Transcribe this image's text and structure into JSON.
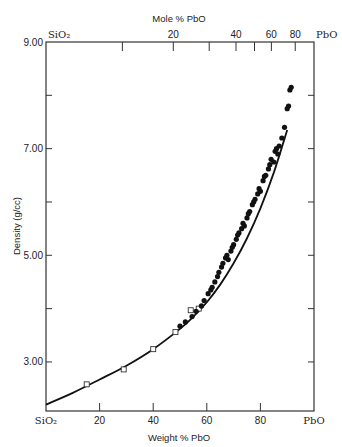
{
  "chart_data": {
    "type": "scatter",
    "title": "",
    "xlabel": "Weight % PbO",
    "ylabel": "Density (g/cc)",
    "top_xlabel": "Mole % PbO",
    "xlim": [
      0,
      100
    ],
    "ylim": [
      2.08,
      9.0
    ],
    "grid": false,
    "legend": "none",
    "x_ticks": [
      {
        "value": 0,
        "label": "SiO₂"
      },
      {
        "value": 20,
        "label": "20"
      },
      {
        "value": 40,
        "label": "40"
      },
      {
        "value": 60,
        "label": "60"
      },
      {
        "value": 80,
        "label": "80"
      },
      {
        "value": 100,
        "label": "PbO"
      }
    ],
    "y_ticks": [
      {
        "value": 9.0,
        "label": "9.00"
      },
      {
        "value": 8.0,
        "label": ""
      },
      {
        "value": 7.0,
        "label": "7.00"
      },
      {
        "value": 6.0,
        "label": ""
      },
      {
        "value": 5.0,
        "label": "5.00"
      },
      {
        "value": 4.0,
        "label": ""
      },
      {
        "value": 3.0,
        "label": "3.00"
      }
    ],
    "top_ticks": [
      {
        "mole": 0,
        "weight": 0,
        "label": "SiO₂"
      },
      {
        "mole": 10,
        "weight": 28.5,
        "label": ""
      },
      {
        "mole": 20,
        "weight": 47.5,
        "label": "20"
      },
      {
        "mole": 30,
        "weight": 60.9,
        "label": ""
      },
      {
        "mole": 40,
        "weight": 70.9,
        "label": "40"
      },
      {
        "mole": 50,
        "weight": 77.8,
        "label": ""
      },
      {
        "mole": 60,
        "weight": 84.1,
        "label": "60"
      },
      {
        "mole": 80,
        "weight": 93.0,
        "label": "80"
      },
      {
        "mole": 100,
        "weight": 100,
        "label": "PbO"
      }
    ],
    "series": [
      {
        "name": "fitted curve",
        "kind": "line",
        "x": [
          0,
          10,
          20,
          30,
          40,
          50,
          55,
          60,
          65,
          70,
          75,
          80,
          85,
          90
        ],
        "y": [
          2.2,
          2.42,
          2.67,
          2.93,
          3.24,
          3.62,
          3.85,
          4.12,
          4.45,
          4.85,
          5.32,
          5.88,
          6.55,
          7.35
        ]
      },
      {
        "name": "open squares",
        "kind": "open-square",
        "x": [
          15.2,
          29,
          40,
          48.3,
          54,
          57
        ],
        "y": [
          2.58,
          2.86,
          3.24,
          3.56,
          3.97,
          4.0
        ]
      },
      {
        "name": "filled circles",
        "kind": "filled-circle",
        "x": [
          50,
          52,
          54.5,
          56,
          58,
          59,
          60.5,
          61.5,
          62,
          63,
          64,
          64.5,
          65.5,
          66,
          67,
          67.5,
          68,
          69,
          69.5,
          70,
          71,
          71.5,
          72,
          73,
          73.5,
          74,
          75,
          75.5,
          76,
          77,
          77.5,
          78,
          79,
          79.5,
          80,
          81,
          81.5,
          82,
          83,
          83.5,
          84,
          85,
          85.5,
          86,
          86.5,
          87,
          88,
          89,
          90,
          90.5,
          91,
          91.5
        ],
        "y": [
          3.67,
          3.75,
          3.85,
          3.95,
          4.05,
          4.15,
          4.28,
          4.35,
          4.4,
          4.5,
          4.6,
          4.68,
          4.78,
          4.85,
          4.95,
          5.0,
          4.92,
          5.08,
          5.15,
          5.2,
          5.3,
          5.38,
          5.42,
          5.5,
          5.6,
          5.55,
          5.7,
          5.78,
          5.82,
          5.95,
          6.0,
          6.05,
          6.15,
          6.25,
          6.2,
          6.4,
          6.48,
          6.5,
          6.62,
          6.7,
          6.8,
          6.75,
          6.95,
          7.0,
          6.9,
          7.05,
          7.2,
          7.4,
          7.75,
          7.8,
          8.1,
          8.15
        ]
      }
    ]
  }
}
